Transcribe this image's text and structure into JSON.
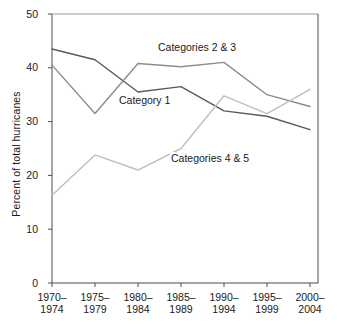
{
  "chart_data": {
    "type": "line",
    "title": "",
    "xlabel": "",
    "ylabel": "Percent of total hurricanes",
    "ylim": [
      0,
      50
    ],
    "yticks": [
      0,
      10,
      20,
      30,
      40,
      50
    ],
    "ytick_labels": [
      "0",
      "10",
      "20",
      "30",
      "40",
      "50"
    ],
    "grid": false,
    "legend_position": "inline-annotations",
    "categories": [
      "1970–1974",
      "1975–1979",
      "1980–1984",
      "1985–1989",
      "1990–1994",
      "1995–1999",
      "2000–2004"
    ],
    "category_lines": [
      [
        "1970–",
        "1974"
      ],
      [
        "1975–",
        "1979"
      ],
      [
        "1980–",
        "1984"
      ],
      [
        "1985–",
        "1989"
      ],
      [
        "1990–",
        "1994"
      ],
      [
        "1995–",
        "1999"
      ],
      [
        "2000–",
        "2004"
      ]
    ],
    "series": [
      {
        "name": "Category 1",
        "color": "#595959",
        "values": [
          43.5,
          41.5,
          35.5,
          36.5,
          32.0,
          31.0,
          28.5
        ]
      },
      {
        "name": "Categories 2 & 3",
        "color": "#8c8c8c",
        "values": [
          40.5,
          31.5,
          40.8,
          40.2,
          41.0,
          35.0,
          32.8
        ]
      },
      {
        "name": "Categories 4 & 5",
        "color": "#bfbfbf",
        "values": [
          16.3,
          23.8,
          21.0,
          25.0,
          34.8,
          31.5,
          36.0
        ]
      }
    ],
    "annotations": [
      {
        "text": "Categories 2 & 3",
        "x": 157,
        "y": 41
      },
      {
        "text": "Category 1",
        "x": 118,
        "y": 94
      },
      {
        "text": "Categories 4 & 5",
        "x": 170,
        "y": 152
      }
    ]
  },
  "axes": {
    "y_axis_title": "Percent of total hurricanes"
  }
}
